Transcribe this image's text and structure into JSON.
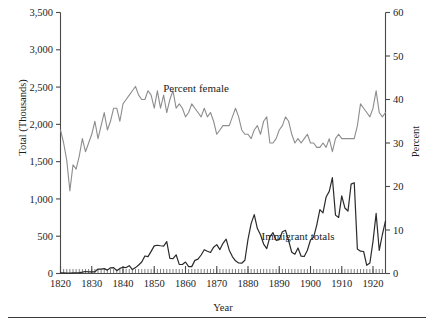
{
  "figure": {
    "background": "#ffffff",
    "rule_color": "#3a3a3a"
  },
  "axes": {
    "x_title": "Year",
    "y_left_title": "Total (Thousands)",
    "y_right_title": "Percent",
    "x_ticks": [
      "1820",
      "1830",
      "1840",
      "1850",
      "1860",
      "1870",
      "1880",
      "1890",
      "1900",
      "1910",
      "1920"
    ],
    "y_left_ticks": [
      "0",
      "500",
      "1,000",
      "1,500",
      "2,000",
      "2,500",
      "3,000",
      "3,500"
    ],
    "y_right_ticks": [
      "0",
      "10",
      "20",
      "30",
      "40",
      "50",
      "60"
    ]
  },
  "annotations": [
    {
      "name": "percent-female-label",
      "text": "Percent female",
      "x": 196,
      "y": 92
    },
    {
      "name": "immigrant-totals-label",
      "text": "Immigrant totals",
      "x": 298,
      "y": 240
    }
  ],
  "chart_data": {
    "type": "line",
    "title": "",
    "subtitle": "",
    "xlabel": "Year",
    "ylabel": "Total (Thousands)",
    "y2label": "Percent",
    "xlim": [
      1820,
      1924
    ],
    "ylim": [
      0,
      3500
    ],
    "y2lim": [
      0,
      60
    ],
    "grid": false,
    "legend": "annotated-inline",
    "xticks": [
      1820,
      1830,
      1840,
      1850,
      1860,
      1870,
      1880,
      1890,
      1900,
      1910,
      1920
    ],
    "yticks": [
      0,
      500,
      1000,
      1500,
      2000,
      2500,
      3000,
      3500
    ],
    "y2ticks": [
      0,
      10,
      20,
      30,
      40,
      50,
      60
    ],
    "minor_xticks": "annual",
    "x": [
      1820,
      1821,
      1822,
      1823,
      1824,
      1825,
      1826,
      1827,
      1828,
      1829,
      1830,
      1831,
      1832,
      1833,
      1834,
      1835,
      1836,
      1837,
      1838,
      1839,
      1840,
      1841,
      1842,
      1843,
      1844,
      1845,
      1846,
      1847,
      1848,
      1849,
      1850,
      1851,
      1852,
      1853,
      1854,
      1855,
      1856,
      1857,
      1858,
      1859,
      1860,
      1861,
      1862,
      1863,
      1864,
      1865,
      1866,
      1867,
      1868,
      1869,
      1870,
      1871,
      1872,
      1873,
      1874,
      1875,
      1876,
      1877,
      1878,
      1879,
      1880,
      1881,
      1882,
      1883,
      1884,
      1885,
      1886,
      1887,
      1888,
      1889,
      1890,
      1891,
      1892,
      1893,
      1894,
      1895,
      1896,
      1897,
      1898,
      1899,
      1900,
      1901,
      1902,
      1903,
      1904,
      1905,
      1906,
      1907,
      1908,
      1909,
      1910,
      1911,
      1912,
      1913,
      1914,
      1915,
      1916,
      1917,
      1918,
      1919,
      1920,
      1921,
      1922,
      1923,
      1924
    ],
    "series": [
      {
        "name": "Immigrant totals",
        "axis": "left",
        "units": "thousands",
        "color": "#2a2a2a",
        "width": 1.2,
        "values": [
          8,
          9,
          6,
          6,
          8,
          10,
          11,
          18,
          27,
          22,
          23,
          23,
          60,
          59,
          65,
          45,
          76,
          79,
          38,
          68,
          84,
          80,
          104,
          52,
          79,
          114,
          154,
          235,
          226,
          297,
          370,
          379,
          372,
          368,
          428,
          201,
          200,
          251,
          123,
          121,
          154,
          92,
          92,
          176,
          193,
          248,
          319,
          299,
          282,
          353,
          387,
          321,
          405,
          460,
          313,
          227,
          170,
          141,
          138,
          178,
          457,
          669,
          789,
          603,
          519,
          395,
          334,
          490,
          547,
          444,
          455,
          560,
          579,
          440,
          285,
          259,
          343,
          231,
          229,
          312,
          449,
          488,
          649,
          857,
          813,
          1026,
          1101,
          1285,
          783,
          752,
          1042,
          879,
          838,
          1198,
          1218,
          327,
          299,
          295,
          110,
          141,
          430,
          805,
          309,
          523,
          707
        ]
      },
      {
        "name": "Percent female",
        "axis": "right",
        "units": "percent",
        "color": "#8d8d8d",
        "width": 1.1,
        "values": [
          33,
          30,
          26,
          19,
          25,
          24,
          27,
          31,
          28,
          30,
          32,
          35,
          31,
          34,
          37,
          33,
          35,
          38,
          38,
          35,
          39,
          40,
          41,
          42,
          43,
          41,
          40,
          40,
          42,
          41,
          38,
          42,
          38,
          41,
          37,
          40,
          42,
          38,
          39,
          38,
          36,
          37,
          39,
          38,
          37,
          36,
          38,
          36,
          37,
          35,
          32,
          33,
          34,
          34,
          34,
          36,
          38,
          36,
          33,
          32,
          32,
          31,
          33,
          34,
          32,
          35,
          36,
          30,
          30,
          31,
          33,
          34,
          36,
          35,
          32,
          30,
          31,
          30,
          31,
          32,
          30,
          30,
          29,
          29,
          30,
          29,
          31,
          28,
          31,
          32,
          31,
          31,
          31,
          31,
          31,
          34,
          39,
          38,
          37,
          36,
          38,
          42,
          37,
          36,
          37
        ]
      }
    ]
  }
}
